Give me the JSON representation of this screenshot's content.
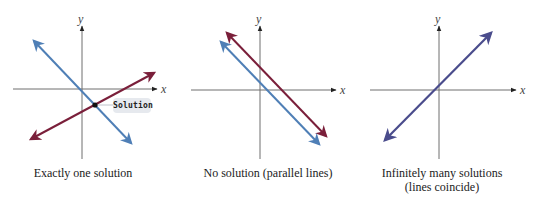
{
  "figure": {
    "colors": {
      "line_blue": "#4f7fb6",
      "line_red": "#7a1f3a",
      "line_coincide": "#4a4c8c",
      "axis": "#6f6f6f",
      "solution_tag_bg": "#e6e9ee",
      "solution_point": "#111111"
    },
    "panels": [
      {
        "id": "one-solution",
        "axis_labels": {
          "x": "x",
          "y": "y"
        },
        "caption": "Exactly one solution",
        "annotation": "Solution",
        "lines": [
          {
            "name": "blue line",
            "slope_sign": "negative"
          },
          {
            "name": "red line",
            "slope_sign": "positive"
          }
        ]
      },
      {
        "id": "no-solution",
        "axis_labels": {
          "x": "x",
          "y": "y"
        },
        "caption": "No solution (parallel lines)",
        "lines": [
          {
            "name": "red line",
            "slope_sign": "negative"
          },
          {
            "name": "blue line",
            "slope_sign": "negative"
          }
        ]
      },
      {
        "id": "infinitely-many",
        "axis_labels": {
          "x": "x",
          "y": "y"
        },
        "caption_line1": "Infinitely many solutions",
        "caption_line2": "(lines coincide)",
        "lines": [
          {
            "name": "coincident line",
            "slope_sign": "positive"
          }
        ]
      }
    ]
  }
}
